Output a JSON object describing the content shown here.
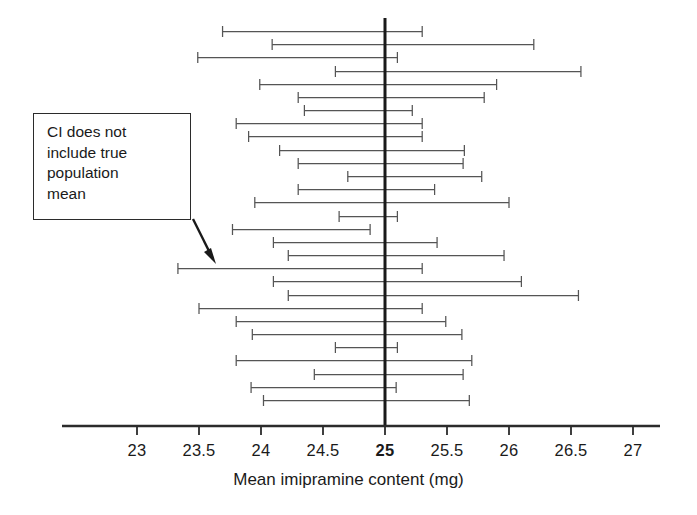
{
  "chart_data": {
    "type": "error-bar",
    "title": "",
    "xlabel": "Mean imipramine content  (mg)",
    "ylabel": "",
    "xlim": [
      22.6,
      27.25
    ],
    "ticks": [
      23,
      23.5,
      24,
      24.5,
      25,
      25.5,
      26,
      26.5,
      27
    ],
    "tick_labels": [
      "23",
      "23.5",
      "24",
      "24.5",
      "25",
      "25.5",
      "26",
      "26.5",
      "27"
    ],
    "bold_tick": "25",
    "reference_line": 25,
    "reference_line_label": "true population mean",
    "grid": false,
    "legend": null,
    "series_name": "95% confidence intervals",
    "intervals": [
      {
        "index": 1,
        "low": 23.69,
        "high": 25.3,
        "covers_true_mean": true
      },
      {
        "index": 2,
        "low": 24.09,
        "high": 26.2,
        "covers_true_mean": true
      },
      {
        "index": 3,
        "low": 23.49,
        "high": 25.1,
        "covers_true_mean": true
      },
      {
        "index": 4,
        "low": 24.6,
        "high": 26.58,
        "covers_true_mean": true
      },
      {
        "index": 5,
        "low": 23.99,
        "high": 25.9,
        "covers_true_mean": true
      },
      {
        "index": 6,
        "low": 24.3,
        "high": 25.8,
        "covers_true_mean": true
      },
      {
        "index": 7,
        "low": 24.35,
        "high": 25.22,
        "covers_true_mean": true
      },
      {
        "index": 8,
        "low": 23.8,
        "high": 25.3,
        "covers_true_mean": true
      },
      {
        "index": 9,
        "low": 23.9,
        "high": 25.3,
        "covers_true_mean": true
      },
      {
        "index": 10,
        "low": 24.15,
        "high": 25.64,
        "covers_true_mean": true
      },
      {
        "index": 11,
        "low": 24.3,
        "high": 25.63,
        "covers_true_mean": true
      },
      {
        "index": 12,
        "low": 24.7,
        "high": 25.78,
        "covers_true_mean": true
      },
      {
        "index": 13,
        "low": 24.3,
        "high": 25.4,
        "covers_true_mean": true
      },
      {
        "index": 14,
        "low": 23.95,
        "high": 26.0,
        "covers_true_mean": true
      },
      {
        "index": 15,
        "low": 24.63,
        "high": 25.1,
        "covers_true_mean": true
      },
      {
        "index": 16,
        "low": 23.77,
        "high": 24.88,
        "covers_true_mean": false
      },
      {
        "index": 17,
        "low": 24.1,
        "high": 25.42,
        "covers_true_mean": true
      },
      {
        "index": 18,
        "low": 24.22,
        "high": 25.96,
        "covers_true_mean": true
      },
      {
        "index": 19,
        "low": 23.33,
        "high": 25.3,
        "covers_true_mean": true
      },
      {
        "index": 20,
        "low": 24.1,
        "high": 26.1,
        "covers_true_mean": true
      },
      {
        "index": 21,
        "low": 24.22,
        "high": 26.56,
        "covers_true_mean": true
      },
      {
        "index": 22,
        "low": 23.5,
        "high": 25.3,
        "covers_true_mean": true
      },
      {
        "index": 23,
        "low": 23.8,
        "high": 25.49,
        "covers_true_mean": true
      },
      {
        "index": 24,
        "low": 23.93,
        "high": 25.62,
        "covers_true_mean": true
      },
      {
        "index": 25,
        "low": 24.6,
        "high": 25.1,
        "covers_true_mean": true
      },
      {
        "index": 26,
        "low": 23.8,
        "high": 25.7,
        "covers_true_mean": true
      },
      {
        "index": 27,
        "low": 24.43,
        "high": 25.63,
        "covers_true_mean": true
      },
      {
        "index": 28,
        "low": 23.92,
        "high": 25.09,
        "covers_true_mean": true
      },
      {
        "index": 29,
        "low": 24.02,
        "high": 25.68,
        "covers_true_mean": true
      }
    ]
  },
  "annotation": {
    "text": "CI does not\ninclude true\npopulation\nmean",
    "target_interval_index": 16
  },
  "colors": {
    "axis": "#2b2b2b",
    "reference_line": "#1a1a1a",
    "interval": "#555555",
    "annotation_border": "#2b2b2b",
    "text": "#1a1a1a"
  }
}
